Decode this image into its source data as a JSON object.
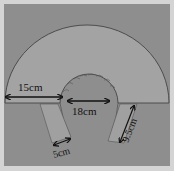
{
  "diagram": {
    "colors": {
      "background": "#8e8e8e",
      "frame": "#d4d4d4",
      "paper": "#a3a3a3",
      "outline": "#3a3a3a",
      "arrow": "#111111"
    },
    "labels": {
      "outer_width": "15cm",
      "inner_diameter": "18cm",
      "strip_width": "5cm",
      "strip_length": "9.5cm"
    }
  }
}
